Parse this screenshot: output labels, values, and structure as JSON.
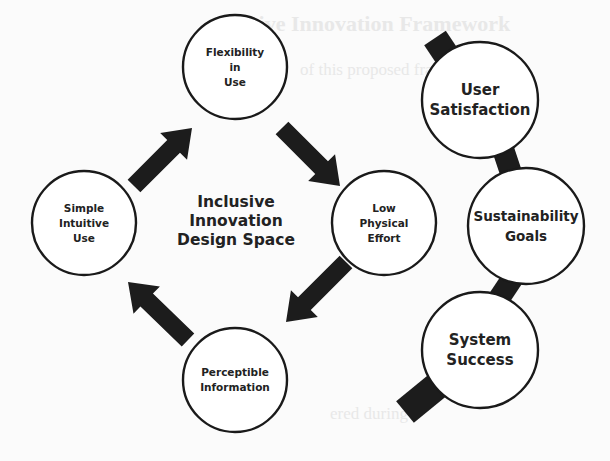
{
  "diagram": {
    "center_label": [
      "Inclusive",
      "Innovation",
      "Design Space"
    ],
    "cycle_nodes": [
      {
        "id": "flexibility",
        "lines": [
          "Flexibility",
          "in",
          "Use"
        ],
        "cx": 235,
        "cy": 67,
        "r": 52
      },
      {
        "id": "low-physical-effort",
        "lines": [
          "Low",
          "Physical",
          "Effort"
        ],
        "cx": 384,
        "cy": 223,
        "r": 52
      },
      {
        "id": "perceptible-information",
        "lines": [
          "Perceptible",
          "Information"
        ],
        "cx": 235,
        "cy": 380,
        "r": 52
      },
      {
        "id": "simple-intuitive-use",
        "lines": [
          "Simple",
          "Intuitive",
          "Use"
        ],
        "cx": 84,
        "cy": 223,
        "r": 52
      }
    ],
    "outcome_nodes": [
      {
        "id": "user-satisfaction",
        "lines": [
          "User",
          "Satisfaction"
        ],
        "cx": 480,
        "cy": 100,
        "r": 58
      },
      {
        "id": "sustainability-goals",
        "lines": [
          "Sustainability",
          "Goals"
        ],
        "cx": 526,
        "cy": 226,
        "r": 58
      },
      {
        "id": "system-success",
        "lines": [
          "System",
          "Success"
        ],
        "cx": 480,
        "cy": 350,
        "r": 58
      }
    ],
    "cycle_arrows": [
      {
        "from": "simple-intuitive-use",
        "to": "flexibility"
      },
      {
        "from": "flexibility",
        "to": "low-physical-effort"
      },
      {
        "from": "low-physical-effort",
        "to": "perceptible-information"
      },
      {
        "from": "perceptible-information",
        "to": "simple-intuitive-use"
      }
    ],
    "colors": {
      "stroke": "#1a1a1a",
      "arrow_fill": "#1c1c1c",
      "node_fill": "#ffffff",
      "text": "#222222",
      "background": "#fbfbfb"
    }
  },
  "background_bleed": {
    "note": "faint illegible bleed-through text from the reverse of a scanned page; only fragments visible",
    "visible_fragments": [
      "sive Innovation Framework",
      "of this proposed framework",
      "ered during"
    ]
  }
}
